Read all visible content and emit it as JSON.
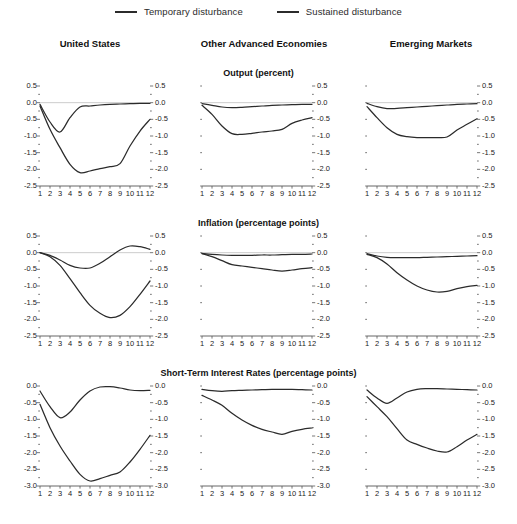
{
  "legend": {
    "items": [
      {
        "label": "Temporary disturbance",
        "color": "#2b2b2b",
        "dash": "none"
      },
      {
        "label": "Sustained disturbance",
        "color": "#2b2b2b",
        "dash": "none"
      }
    ]
  },
  "columns": [
    {
      "title": "United States"
    },
    {
      "title": "Other Advanced Economies"
    },
    {
      "title": "Emerging Markets"
    }
  ],
  "rows": [
    {
      "title": "Output (percent)"
    },
    {
      "title": "Inflation (percentage points)"
    },
    {
      "title": "Short-Term Interest Rates (percentage points)"
    }
  ],
  "axes": {
    "x": {
      "ticks": [
        "1",
        "2",
        "3",
        "4",
        "5",
        "6",
        "7",
        "8",
        "9",
        "10",
        "11",
        "12"
      ],
      "min": 1,
      "max": 12
    },
    "y_output": {
      "ticks": [
        "0.5",
        "0.0",
        "-0.5",
        "-1.0",
        "-1.5",
        "-2.0",
        "-2.5"
      ],
      "min": -2.5,
      "max": 0.5
    },
    "y_inflation": {
      "ticks": [
        "0.5",
        "0.0",
        "-0.5",
        "-1.0",
        "-1.5",
        "-2.0",
        "-2.5"
      ],
      "min": -2.5,
      "max": 0.5
    },
    "y_rates": {
      "ticks": [
        "0.0",
        "-0.5",
        "-1.0",
        "-1.5",
        "-2.0",
        "-2.5",
        "-3.0"
      ],
      "min": -3.0,
      "max": 0.0
    }
  },
  "chart_data": [
    {
      "type": "line",
      "title": "Output (percent) — United States",
      "panel_row": "Output (percent)",
      "panel_col": "United States",
      "xlabel": "",
      "ylabel": "percent",
      "x": [
        1,
        2,
        3,
        4,
        5,
        6,
        7,
        8,
        9,
        10,
        11,
        12
      ],
      "xlim": [
        1,
        12
      ],
      "ylim": [
        -2.5,
        0.5
      ],
      "grid": false,
      "legend_position": "top-center",
      "series": [
        {
          "name": "Temporary disturbance",
          "values": [
            -0.05,
            -0.58,
            -0.88,
            -0.45,
            -0.13,
            -0.1,
            -0.07,
            -0.05,
            -0.04,
            -0.03,
            -0.02,
            -0.02
          ]
        },
        {
          "name": "Sustained disturbance",
          "values": [
            -0.1,
            -0.8,
            -1.35,
            -1.85,
            -2.1,
            -2.05,
            -1.98,
            -1.92,
            -1.83,
            -1.3,
            -0.85,
            -0.5
          ]
        }
      ]
    },
    {
      "type": "line",
      "title": "Output (percent) — Other Advanced Economies",
      "panel_row": "Output (percent)",
      "panel_col": "Other Advanced Economies",
      "xlabel": "",
      "ylabel": "percent",
      "x": [
        1,
        2,
        3,
        4,
        5,
        6,
        7,
        8,
        9,
        10,
        11,
        12
      ],
      "xlim": [
        1,
        12
      ],
      "ylim": [
        -2.5,
        0.5
      ],
      "grid": false,
      "legend_position": "top-center",
      "series": [
        {
          "name": "Temporary disturbance",
          "values": [
            -0.03,
            -0.08,
            -0.13,
            -0.15,
            -0.14,
            -0.12,
            -0.1,
            -0.08,
            -0.07,
            -0.06,
            -0.05,
            -0.05
          ]
        },
        {
          "name": "Sustained disturbance",
          "values": [
            -0.08,
            -0.35,
            -0.7,
            -0.93,
            -0.95,
            -0.92,
            -0.88,
            -0.85,
            -0.8,
            -0.62,
            -0.52,
            -0.45
          ]
        }
      ]
    },
    {
      "type": "line",
      "title": "Output (percent) — Emerging Markets",
      "panel_row": "Output (percent)",
      "panel_col": "Emerging Markets",
      "xlabel": "",
      "ylabel": "percent",
      "x": [
        1,
        2,
        3,
        4,
        5,
        6,
        7,
        8,
        9,
        10,
        11,
        12
      ],
      "xlim": [
        1,
        12
      ],
      "ylim": [
        -2.5,
        0.5
      ],
      "grid": false,
      "legend_position": "top-center",
      "series": [
        {
          "name": "Temporary disturbance",
          "values": [
            -0.02,
            -0.12,
            -0.18,
            -0.17,
            -0.15,
            -0.13,
            -0.11,
            -0.09,
            -0.07,
            -0.05,
            -0.04,
            -0.03
          ]
        },
        {
          "name": "Sustained disturbance",
          "values": [
            -0.12,
            -0.45,
            -0.75,
            -0.95,
            -1.02,
            -1.05,
            -1.05,
            -1.05,
            -1.03,
            -0.82,
            -0.65,
            -0.48
          ]
        }
      ]
    },
    {
      "type": "line",
      "title": "Inflation (percentage points) — United States",
      "panel_row": "Inflation (percentage points)",
      "panel_col": "United States",
      "xlabel": "",
      "ylabel": "percentage points",
      "x": [
        1,
        2,
        3,
        4,
        5,
        6,
        7,
        8,
        9,
        10,
        11,
        12
      ],
      "xlim": [
        1,
        12
      ],
      "ylim": [
        -2.5,
        0.5
      ],
      "grid": false,
      "legend_position": "top-center",
      "series": [
        {
          "name": "Temporary disturbance",
          "values": [
            0.0,
            -0.08,
            -0.22,
            -0.38,
            -0.46,
            -0.46,
            -0.32,
            -0.12,
            0.08,
            0.2,
            0.18,
            0.1
          ]
        },
        {
          "name": "Sustained disturbance",
          "values": [
            0.0,
            -0.12,
            -0.38,
            -0.78,
            -1.2,
            -1.58,
            -1.82,
            -1.95,
            -1.88,
            -1.62,
            -1.25,
            -0.85
          ]
        }
      ]
    },
    {
      "type": "line",
      "title": "Inflation (percentage points) — Other Advanced Economies",
      "panel_row": "Inflation (percentage points)",
      "panel_col": "Other Advanced Economies",
      "xlabel": "",
      "ylabel": "percentage points",
      "x": [
        1,
        2,
        3,
        4,
        5,
        6,
        7,
        8,
        9,
        10,
        11,
        12
      ],
      "xlim": [
        1,
        12
      ],
      "ylim": [
        -2.5,
        0.5
      ],
      "grid": false,
      "legend_position": "top-center",
      "series": [
        {
          "name": "Temporary disturbance",
          "values": [
            -0.02,
            -0.05,
            -0.07,
            -0.08,
            -0.08,
            -0.08,
            -0.07,
            -0.07,
            -0.06,
            -0.05,
            -0.05,
            -0.04
          ]
        },
        {
          "name": "Sustained disturbance",
          "values": [
            -0.03,
            -0.12,
            -0.24,
            -0.36,
            -0.4,
            -0.44,
            -0.48,
            -0.52,
            -0.55,
            -0.52,
            -0.48,
            -0.45
          ]
        }
      ]
    },
    {
      "type": "line",
      "title": "Inflation (percentage points) — Emerging Markets",
      "panel_row": "Inflation (percentage points)",
      "panel_col": "Emerging Markets",
      "xlabel": "",
      "ylabel": "percentage points",
      "x": [
        1,
        2,
        3,
        4,
        5,
        6,
        7,
        8,
        9,
        10,
        11,
        12
      ],
      "xlim": [
        1,
        12
      ],
      "ylim": [
        -2.5,
        0.5
      ],
      "grid": false,
      "legend_position": "top-center",
      "series": [
        {
          "name": "Temporary disturbance",
          "values": [
            -0.03,
            -0.1,
            -0.14,
            -0.15,
            -0.15,
            -0.15,
            -0.14,
            -0.13,
            -0.12,
            -0.11,
            -0.1,
            -0.09
          ]
        },
        {
          "name": "Sustained disturbance",
          "values": [
            -0.05,
            -0.15,
            -0.34,
            -0.6,
            -0.82,
            -1.0,
            -1.12,
            -1.18,
            -1.16,
            -1.08,
            -1.02,
            -0.98
          ]
        }
      ]
    },
    {
      "type": "line",
      "title": "Short-Term Interest Rates (percentage points) — United States",
      "panel_row": "Short-Term Interest Rates (percentage points)",
      "panel_col": "United States",
      "xlabel": "",
      "ylabel": "percentage points",
      "x": [
        1,
        2,
        3,
        4,
        5,
        6,
        7,
        8,
        9,
        10,
        11,
        12
      ],
      "xlim": [
        1,
        12
      ],
      "ylim": [
        -3.0,
        0.0
      ],
      "grid": false,
      "legend_position": "top-center",
      "series": [
        {
          "name": "Temporary disturbance",
          "values": [
            -0.15,
            -0.62,
            -0.95,
            -0.78,
            -0.42,
            -0.15,
            -0.03,
            -0.02,
            -0.06,
            -0.12,
            -0.14,
            -0.13
          ]
        },
        {
          "name": "Sustained disturbance",
          "values": [
            -0.55,
            -1.25,
            -1.8,
            -2.25,
            -2.65,
            -2.85,
            -2.78,
            -2.68,
            -2.58,
            -2.28,
            -1.9,
            -1.48
          ]
        }
      ]
    },
    {
      "type": "line",
      "title": "Short-Term Interest Rates (percentage points) — Other Advanced Economies",
      "panel_row": "Short-Term Interest Rates (percentage points)",
      "panel_col": "Other Advanced Economies",
      "xlabel": "",
      "ylabel": "percentage points",
      "x": [
        1,
        2,
        3,
        4,
        5,
        6,
        7,
        8,
        9,
        10,
        11,
        12
      ],
      "xlim": [
        1,
        12
      ],
      "ylim": [
        -3.0,
        0.0
      ],
      "grid": false,
      "legend_position": "top-center",
      "series": [
        {
          "name": "Temporary disturbance",
          "values": [
            -0.1,
            -0.14,
            -0.16,
            -0.14,
            -0.13,
            -0.12,
            -0.11,
            -0.1,
            -0.1,
            -0.1,
            -0.11,
            -0.12
          ]
        },
        {
          "name": "Sustained disturbance",
          "values": [
            -0.28,
            -0.42,
            -0.58,
            -0.82,
            -1.02,
            -1.18,
            -1.3,
            -1.38,
            -1.45,
            -1.36,
            -1.3,
            -1.26
          ]
        }
      ]
    },
    {
      "type": "line",
      "title": "Short-Term Interest Rates (percentage points) — Emerging Markets",
      "panel_row": "Short-Term Interest Rates (percentage points)",
      "panel_col": "Emerging Markets",
      "xlabel": "",
      "ylabel": "percentage points",
      "x": [
        1,
        2,
        3,
        4,
        5,
        6,
        7,
        8,
        9,
        10,
        11,
        12
      ],
      "xlim": [
        1,
        12
      ],
      "ylim": [
        -3.0,
        0.0
      ],
      "grid": false,
      "legend_position": "top-center",
      "series": [
        {
          "name": "Temporary disturbance",
          "values": [
            -0.12,
            -0.36,
            -0.52,
            -0.36,
            -0.18,
            -0.1,
            -0.08,
            -0.08,
            -0.09,
            -0.1,
            -0.11,
            -0.12
          ]
        },
        {
          "name": "Sustained disturbance",
          "values": [
            -0.32,
            -0.62,
            -0.92,
            -1.28,
            -1.62,
            -1.75,
            -1.86,
            -1.95,
            -1.98,
            -1.82,
            -1.62,
            -1.45
          ]
        }
      ]
    }
  ],
  "style": {
    "line_color": "#2b2b2b",
    "axis_color": "#555555",
    "zero_line_color": "#bfbfbf",
    "background": "#ffffff"
  }
}
